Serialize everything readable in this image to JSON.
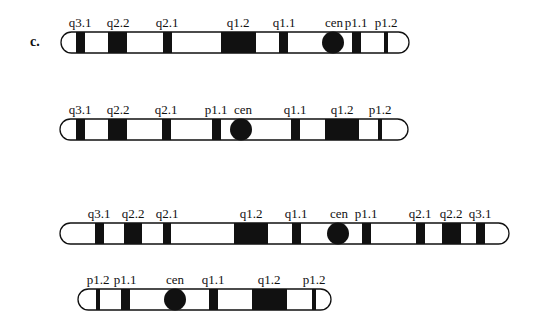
{
  "panel_label": "c.",
  "chromosomes": [
    {
      "id": "chr1",
      "x1": 61,
      "x2": 409,
      "y": 32,
      "h": 21,
      "bands": [
        {
          "label": "q3.1",
          "x": 76,
          "w": 9,
          "label_x": 80
        },
        {
          "label": "q2.2",
          "x": 108,
          "w": 19,
          "label_x": 118
        },
        {
          "label": "q2.1",
          "x": 163,
          "w": 9,
          "label_x": 167
        },
        {
          "label": "q1.2",
          "x": 221,
          "w": 35,
          "label_x": 238
        },
        {
          "label": "q1.1",
          "x": 279,
          "w": 9,
          "label_x": 284
        },
        {
          "label": "p1.1",
          "x": 352,
          "w": 9,
          "label_x": 356
        },
        {
          "label": "p1.2",
          "x": 384,
          "w": 4,
          "label_x": 386
        }
      ],
      "centromere": {
        "label": "cen",
        "cx": 333,
        "r": 11,
        "label_x": 334
      }
    },
    {
      "id": "chr2",
      "x1": 60,
      "x2": 408,
      "y": 119,
      "h": 21,
      "bands": [
        {
          "label": "q3.1",
          "x": 76,
          "w": 9,
          "label_x": 80
        },
        {
          "label": "q2.2",
          "x": 108,
          "w": 19,
          "label_x": 118
        },
        {
          "label": "q2.1",
          "x": 162,
          "w": 9,
          "label_x": 166
        },
        {
          "label": "p1.1",
          "x": 212,
          "w": 9,
          "label_x": 216
        },
        {
          "label": "q1.1",
          "x": 291,
          "w": 9,
          "label_x": 295
        },
        {
          "label": "q1.2",
          "x": 325,
          "w": 34,
          "label_x": 342
        },
        {
          "label": "p1.2",
          "x": 378,
          "w": 4,
          "label_x": 380
        }
      ],
      "centromere": {
        "label": "cen",
        "cx": 241,
        "r": 11,
        "label_x": 243
      }
    },
    {
      "id": "chr3",
      "x1": 60,
      "x2": 509,
      "y": 223,
      "h": 21,
      "bands": [
        {
          "label": "q3.1",
          "x": 95,
          "w": 9,
          "label_x": 99
        },
        {
          "label": "q2.2",
          "x": 124,
          "w": 18,
          "label_x": 133
        },
        {
          "label": "q2.1",
          "x": 163,
          "w": 8,
          "label_x": 167
        },
        {
          "label": "q1.2",
          "x": 234,
          "w": 34,
          "label_x": 251
        },
        {
          "label": "q1.1",
          "x": 292,
          "w": 9,
          "label_x": 296
        },
        {
          "label": "p1.1",
          "x": 362,
          "w": 9,
          "label_x": 366
        },
        {
          "label": "q2.1",
          "x": 416,
          "w": 9,
          "label_x": 420
        },
        {
          "label": "q2.2",
          "x": 442,
          "w": 19,
          "label_x": 451
        },
        {
          "label": "q3.1",
          "x": 476,
          "w": 9,
          "label_x": 480
        }
      ],
      "centromere": {
        "label": "cen",
        "cx": 338,
        "r": 11,
        "label_x": 339
      }
    },
    {
      "id": "chr4",
      "x1": 78,
      "x2": 331,
      "y": 289,
      "h": 21,
      "bands": [
        {
          "label": "p1.2",
          "x": 96,
          "w": 4,
          "label_x": 98
        },
        {
          "label": "p1.1",
          "x": 121,
          "w": 9,
          "label_x": 125
        },
        {
          "label": "q1.1",
          "x": 209,
          "w": 9,
          "label_x": 213
        },
        {
          "label": "q1.2",
          "x": 252,
          "w": 35,
          "label_x": 269
        },
        {
          "label": "p1.2",
          "x": 312,
          "w": 4,
          "label_x": 314
        }
      ],
      "centromere": {
        "label": "cen",
        "cx": 175,
        "r": 11,
        "label_x": 175
      }
    }
  ]
}
